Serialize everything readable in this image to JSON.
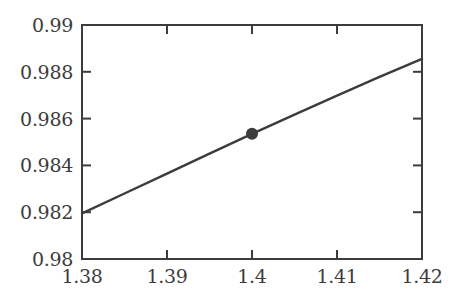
{
  "chart_data": {
    "type": "line",
    "title": "",
    "subtitle": "",
    "xlabel": "",
    "ylabel": "",
    "xlim": [
      1.38,
      1.42
    ],
    "ylim": [
      0.98,
      0.99
    ],
    "grid": false,
    "legend": null,
    "legend_position": "none",
    "xticks": [
      1.38,
      1.39,
      1.4,
      1.41,
      1.42
    ],
    "xtick_labels": [
      "1.38",
      "1.39",
      "1.4",
      "1.41",
      "1.42"
    ],
    "yticks": [
      0.98,
      0.982,
      0.984,
      0.986,
      0.988,
      0.99
    ],
    "ytick_labels": [
      "0.98",
      "0.982",
      "0.984",
      "0.986",
      "0.988",
      "0.99"
    ],
    "tick_direction": "in",
    "frame": "box",
    "line_color": "#3c3c3c",
    "marker_color": "#3c3c3c",
    "axis_color": "#3c3c3c",
    "background_color": "#ffffff",
    "series": [
      {
        "name": "curve",
        "type": "line",
        "x": [
          1.38,
          1.385,
          1.39,
          1.395,
          1.4,
          1.405,
          1.41,
          1.415,
          1.42
        ],
        "y": [
          0.98195,
          0.9828,
          0.98365,
          0.9845,
          0.98535,
          0.98617,
          0.98698,
          0.98778,
          0.98855
        ]
      },
      {
        "name": "highlighted-point",
        "type": "scatter",
        "x": [
          1.4
        ],
        "y": [
          0.98535
        ]
      }
    ]
  }
}
